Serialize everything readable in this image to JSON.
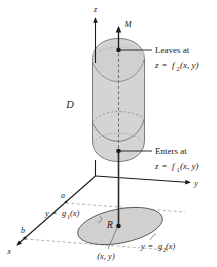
{
  "figure": {
    "type": "math-diagram-3d",
    "colors": {
      "solid_fill": "#d4d4d4",
      "solid_stroke": "#6e6e6e",
      "region_fill": "#d0d0d0",
      "region_stroke": "#555555",
      "axis": "#1a1a1a",
      "dashed": "#8a8a8a",
      "text": "#1a1a1a"
    },
    "axes": [
      {
        "name": "z-axis",
        "label": "z"
      },
      {
        "name": "y-axis",
        "label": "y"
      },
      {
        "name": "x-axis",
        "label": "x"
      }
    ],
    "labels": {
      "z_axis": "z",
      "y_axis": "y",
      "x_axis": "x",
      "vertical_line": "M",
      "solid": "D",
      "region": "R",
      "point": "(x, y)",
      "a_mark": "a",
      "b_mark": "b",
      "leaves_at": "Leaves at",
      "leaves_eq_lhs": "z",
      "leaves_eq_rel": "=",
      "leaves_eq_fn": "f",
      "leaves_eq_sub": "2",
      "leaves_eq_args": "(x, y)",
      "enters_at": "Enters at",
      "enters_eq_lhs": "z",
      "enters_eq_rel": "=",
      "enters_eq_fn": "f",
      "enters_eq_sub": "1",
      "enters_eq_args": "(x, y)",
      "g1_lhs": "y",
      "g1_rel": "=",
      "g1_fn": "g",
      "g1_sub": "1",
      "g1_args": "(x)",
      "g2_lhs": "y",
      "g2_rel": "=",
      "g2_fn": "g",
      "g2_sub": "2",
      "g2_args": "(x)"
    }
  }
}
